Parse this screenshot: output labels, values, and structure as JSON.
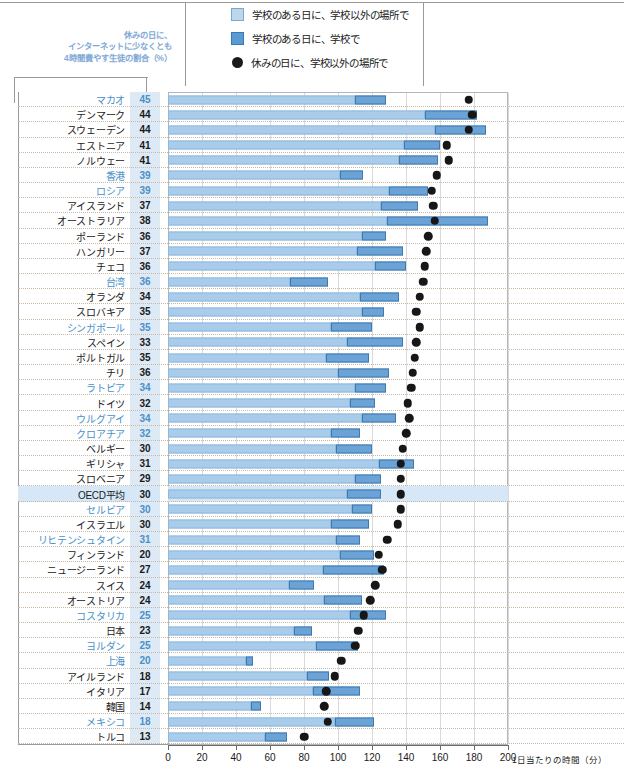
{
  "legend": {
    "items": [
      {
        "marker": "light-square-swatch",
        "label": "学校のある日に、学校以外の場所で"
      },
      {
        "marker": "dark-square-swatch",
        "label": "学校のある日に、学校で"
      },
      {
        "marker": "black-circle-marker",
        "label": "休みの日に、学校以外の場所で"
      }
    ]
  },
  "annotation": {
    "line1": "休みの日に、",
    "line2": "インターネットに少なくとも",
    "line3": "4時間費やす生徒の割合（%）"
  },
  "axis": {
    "ticks": [
      "0",
      "20",
      "40",
      "60",
      "80",
      "100",
      "120",
      "140",
      "160",
      "180",
      "200"
    ],
    "unit": "1日当たりの時間（分）"
  },
  "colors": {
    "light_blue": "#a9ccea",
    "dark_blue": "#6ba3d6",
    "dot": "#171717",
    "highlight_row": "#d6e8f7",
    "value_cell": "#ddeaf6",
    "nonoecd_text": "#4a90c8"
  },
  "chart_data": {
    "type": "bar",
    "title": "",
    "xlabel": "1日当たりの時間（分）",
    "ylabel": "",
    "xlim": [
      0,
      200
    ],
    "grid": true,
    "legend_position": "top",
    "percent_column_header": "休みの日に、インターネットに少なくとも4時間費やす生徒の割合（%）",
    "series": [
      {
        "name": "学校のある日に、学校以外の場所で",
        "key": "school_day_outside"
      },
      {
        "name": "学校のある日に、学校で",
        "key": "school_day_at_school"
      },
      {
        "name": "休みの日に、学校以外の場所で",
        "key": "holiday_outside"
      }
    ],
    "rows": [
      {
        "country": "マカオ",
        "percent": 45,
        "school_day_outside": 110,
        "school_day_at_school": 18,
        "holiday_outside": 177,
        "nonoecd": true,
        "highlight": false
      },
      {
        "country": "デンマーク",
        "percent": 44,
        "school_day_outside": 151,
        "school_day_at_school": 31,
        "holiday_outside": 179,
        "nonoecd": false,
        "highlight": false
      },
      {
        "country": "スウェーデン",
        "percent": 44,
        "school_day_outside": 157,
        "school_day_at_school": 30,
        "holiday_outside": 177,
        "nonoecd": false,
        "highlight": false
      },
      {
        "country": "エストニア",
        "percent": 41,
        "school_day_outside": 139,
        "school_day_at_school": 21,
        "holiday_outside": 164,
        "nonoecd": false,
        "highlight": false
      },
      {
        "country": "ノルウェー",
        "percent": 41,
        "school_day_outside": 136,
        "school_day_at_school": 23,
        "holiday_outside": 165,
        "nonoecd": false,
        "highlight": false
      },
      {
        "country": "香港",
        "percent": 39,
        "school_day_outside": 101,
        "school_day_at_school": 14,
        "holiday_outside": 158,
        "nonoecd": true,
        "highlight": false
      },
      {
        "country": "ロシア",
        "percent": 39,
        "school_day_outside": 130,
        "school_day_at_school": 23,
        "holiday_outside": 155,
        "nonoecd": true,
        "highlight": false
      },
      {
        "country": "アイスランド",
        "percent": 37,
        "school_day_outside": 125,
        "school_day_at_school": 22,
        "holiday_outside": 156,
        "nonoecd": false,
        "highlight": false
      },
      {
        "country": "オーストラリア",
        "percent": 38,
        "school_day_outside": 129,
        "school_day_at_school": 59,
        "holiday_outside": 157,
        "nonoecd": false,
        "highlight": false
      },
      {
        "country": "ポーランド",
        "percent": 36,
        "school_day_outside": 114,
        "school_day_at_school": 14,
        "holiday_outside": 153,
        "nonoecd": false,
        "highlight": false
      },
      {
        "country": "ハンガリー",
        "percent": 37,
        "school_day_outside": 111,
        "school_day_at_school": 27,
        "holiday_outside": 152,
        "nonoecd": false,
        "highlight": false
      },
      {
        "country": "チェコ",
        "percent": 36,
        "school_day_outside": 122,
        "school_day_at_school": 18,
        "holiday_outside": 151,
        "nonoecd": false,
        "highlight": false
      },
      {
        "country": "台湾",
        "percent": 36,
        "school_day_outside": 72,
        "school_day_at_school": 22,
        "holiday_outside": 150,
        "nonoecd": true,
        "highlight": false
      },
      {
        "country": "オランダ",
        "percent": 34,
        "school_day_outside": 113,
        "school_day_at_school": 23,
        "holiday_outside": 148,
        "nonoecd": false,
        "highlight": false
      },
      {
        "country": "スロバキア",
        "percent": 35,
        "school_day_outside": 114,
        "school_day_at_school": 13,
        "holiday_outside": 146,
        "nonoecd": false,
        "highlight": false
      },
      {
        "country": "シンガポール",
        "percent": 35,
        "school_day_outside": 96,
        "school_day_at_school": 24,
        "holiday_outside": 148,
        "nonoecd": true,
        "highlight": false
      },
      {
        "country": "スペイン",
        "percent": 33,
        "school_day_outside": 105,
        "school_day_at_school": 33,
        "holiday_outside": 146,
        "nonoecd": false,
        "highlight": false
      },
      {
        "country": "ポルトガル",
        "percent": 35,
        "school_day_outside": 93,
        "school_day_at_school": 25,
        "holiday_outside": 145,
        "nonoecd": false,
        "highlight": false
      },
      {
        "country": "チリ",
        "percent": 36,
        "school_day_outside": 100,
        "school_day_at_school": 30,
        "holiday_outside": 144,
        "nonoecd": false,
        "highlight": false
      },
      {
        "country": "ラトビア",
        "percent": 34,
        "school_day_outside": 110,
        "school_day_at_school": 18,
        "holiday_outside": 143,
        "nonoecd": true,
        "highlight": false
      },
      {
        "country": "ドイツ",
        "percent": 32,
        "school_day_outside": 107,
        "school_day_at_school": 15,
        "holiday_outside": 141,
        "nonoecd": false,
        "highlight": false
      },
      {
        "country": "ウルグアイ",
        "percent": 34,
        "school_day_outside": 114,
        "school_day_at_school": 20,
        "holiday_outside": 142,
        "nonoecd": true,
        "highlight": false
      },
      {
        "country": "クロアチア",
        "percent": 32,
        "school_day_outside": 96,
        "school_day_at_school": 17,
        "holiday_outside": 140,
        "nonoecd": true,
        "highlight": false
      },
      {
        "country": "ベルギー",
        "percent": 30,
        "school_day_outside": 99,
        "school_day_at_school": 21,
        "holiday_outside": 138,
        "nonoecd": false,
        "highlight": false
      },
      {
        "country": "ギリシャ",
        "percent": 31,
        "school_day_outside": 124,
        "school_day_at_school": 21,
        "holiday_outside": 137,
        "nonoecd": false,
        "highlight": false
      },
      {
        "country": "スロベニア",
        "percent": 29,
        "school_day_outside": 110,
        "school_day_at_school": 15,
        "holiday_outside": 137,
        "nonoecd": false,
        "highlight": false
      },
      {
        "country": "OECD平均",
        "percent": 30,
        "school_day_outside": 105,
        "school_day_at_school": 20,
        "holiday_outside": 137,
        "nonoecd": false,
        "highlight": true
      },
      {
        "country": "セルビア",
        "percent": 30,
        "school_day_outside": 108,
        "school_day_at_school": 12,
        "holiday_outside": 137,
        "nonoecd": true,
        "highlight": false
      },
      {
        "country": "イスラエル",
        "percent": 30,
        "school_day_outside": 96,
        "school_day_at_school": 22,
        "holiday_outside": 135,
        "nonoecd": false,
        "highlight": false
      },
      {
        "country": "リヒテンシュタイン",
        "percent": 31,
        "school_day_outside": 99,
        "school_day_at_school": 14,
        "holiday_outside": 129,
        "nonoecd": true,
        "highlight": false
      },
      {
        "country": "フィンランド",
        "percent": 20,
        "school_day_outside": 101,
        "school_day_at_school": 20,
        "holiday_outside": 124,
        "nonoecd": false,
        "highlight": false
      },
      {
        "country": "ニュージーランド",
        "percent": 27,
        "school_day_outside": 91,
        "school_day_at_school": 36,
        "holiday_outside": 126,
        "nonoecd": false,
        "highlight": false
      },
      {
        "country": "スイス",
        "percent": 24,
        "school_day_outside": 71,
        "school_day_at_school": 15,
        "holiday_outside": 122,
        "nonoecd": false,
        "highlight": false
      },
      {
        "country": "オーストリア",
        "percent": 24,
        "school_day_outside": 92,
        "school_day_at_school": 22,
        "holiday_outside": 119,
        "nonoecd": false,
        "highlight": false
      },
      {
        "country": "コスタリカ",
        "percent": 25,
        "school_day_outside": 107,
        "school_day_at_school": 21,
        "holiday_outside": 115,
        "nonoecd": true,
        "highlight": false
      },
      {
        "country": "日本",
        "percent": 23,
        "school_day_outside": 74,
        "school_day_at_school": 11,
        "holiday_outside": 112,
        "nonoecd": false,
        "highlight": false
      },
      {
        "country": "ヨルダン",
        "percent": 25,
        "school_day_outside": 87,
        "school_day_at_school": 25,
        "holiday_outside": 110,
        "nonoecd": true,
        "highlight": false
      },
      {
        "country": "上海",
        "percent": 20,
        "school_day_outside": 46,
        "school_day_at_school": 4,
        "holiday_outside": 102,
        "nonoecd": true,
        "highlight": false
      },
      {
        "country": "アイルランド",
        "percent": 18,
        "school_day_outside": 82,
        "school_day_at_school": 13,
        "holiday_outside": 98,
        "nonoecd": false,
        "highlight": false
      },
      {
        "country": "イタリア",
        "percent": 17,
        "school_day_outside": 85,
        "school_day_at_school": 28,
        "holiday_outside": 93,
        "nonoecd": false,
        "highlight": false
      },
      {
        "country": "韓国",
        "percent": 14,
        "school_day_outside": 49,
        "school_day_at_school": 6,
        "holiday_outside": 92,
        "nonoecd": false,
        "highlight": false
      },
      {
        "country": "メキシコ",
        "percent": 18,
        "school_day_outside": 98,
        "school_day_at_school": 23,
        "holiday_outside": 94,
        "nonoecd": true,
        "highlight": false
      },
      {
        "country": "トルコ",
        "percent": 13,
        "school_day_outside": 57,
        "school_day_at_school": 13,
        "holiday_outside": 80,
        "nonoecd": false,
        "highlight": false
      }
    ]
  }
}
